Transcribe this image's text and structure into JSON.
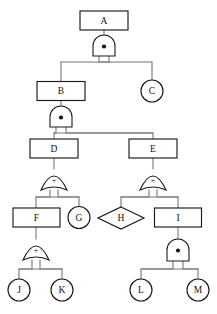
{
  "diagram": {
    "type": "fault-tree",
    "width": 217,
    "height": 314,
    "background_color": "#ffffff",
    "line_color": "#777777",
    "shape_stroke_color": "#1a1a1a",
    "shape_fill_color": "#ffffff"
  },
  "nodes": [
    {
      "id": "A",
      "label": "A",
      "shape": "rectangle",
      "cx": 104,
      "cy": 20.5,
      "w": 48,
      "h": 19,
      "level": 0
    },
    {
      "id": "B",
      "label": "B",
      "shape": "rectangle",
      "cx": 61,
      "cy": 91,
      "w": 48,
      "h": 19,
      "level": 1
    },
    {
      "id": "C",
      "label": "C",
      "shape": "circle",
      "cx": 152,
      "cy": 91,
      "r": 11,
      "level": 1
    },
    {
      "id": "D",
      "label": "D",
      "shape": "rectangle",
      "cx": 54,
      "cy": 148.5,
      "w": 48,
      "h": 19,
      "level": 2
    },
    {
      "id": "E",
      "label": "E",
      "shape": "rectangle",
      "cx": 153,
      "cy": 148.5,
      "w": 48,
      "h": 19,
      "level": 2
    },
    {
      "id": "F",
      "label": "F",
      "shape": "rectangle",
      "cx": 36,
      "cy": 217.5,
      "w": 47,
      "h": 19,
      "level": 3
    },
    {
      "id": "G",
      "label": "G",
      "shape": "circle",
      "cx": 79,
      "cy": 217.5,
      "r": 11,
      "level": 3
    },
    {
      "id": "H",
      "label": "H",
      "shape": "diamond",
      "cx": 121,
      "cy": 218,
      "w": 46,
      "h": 22,
      "level": 3
    },
    {
      "id": "I",
      "label": "I",
      "shape": "rectangle",
      "cx": 178,
      "cy": 217.5,
      "w": 47,
      "h": 19,
      "level": 3
    },
    {
      "id": "J",
      "label": "J",
      "shape": "circle",
      "cx": 19,
      "cy": 290,
      "r": 11,
      "level": 4
    },
    {
      "id": "K",
      "label": "K",
      "shape": "circle",
      "cx": 62,
      "cy": 290,
      "r": 11,
      "level": 4
    },
    {
      "id": "L",
      "label": "L",
      "shape": "circle",
      "cx": 141,
      "cy": 290,
      "r": 11,
      "level": 4
    },
    {
      "id": "M",
      "label": "M",
      "shape": "circle",
      "cx": 198,
      "cy": 290,
      "r": 11,
      "level": 4
    }
  ],
  "gates": [
    {
      "id": "gate-A",
      "type": "AND",
      "symbol": "dot",
      "parent": "A",
      "children": [
        "B",
        "C"
      ],
      "cx": 104,
      "cy": 46
    },
    {
      "id": "gate-B",
      "type": "AND",
      "symbol": "dot",
      "parent": "B",
      "children": [
        "D",
        "E"
      ],
      "cx": 61,
      "cy": 117
    },
    {
      "id": "gate-D",
      "type": "OR",
      "symbol": "+",
      "parent": "D",
      "children": [
        "F",
        "G"
      ],
      "cx": 54,
      "cy": 180
    },
    {
      "id": "gate-E",
      "type": "OR",
      "symbol": "+",
      "parent": "E",
      "children": [
        "H",
        "I"
      ],
      "cx": 153,
      "cy": 180
    },
    {
      "id": "gate-F",
      "type": "OR",
      "symbol": "+",
      "parent": "F",
      "children": [
        "J",
        "K"
      ],
      "cx": 36,
      "cy": 250
    },
    {
      "id": "gate-I",
      "type": "AND",
      "symbol": "dot",
      "parent": "I",
      "children": [
        "L",
        "M"
      ],
      "cx": 178,
      "cy": 250
    }
  ],
  "gate_symbols": {
    "and": "•",
    "or": "+"
  }
}
